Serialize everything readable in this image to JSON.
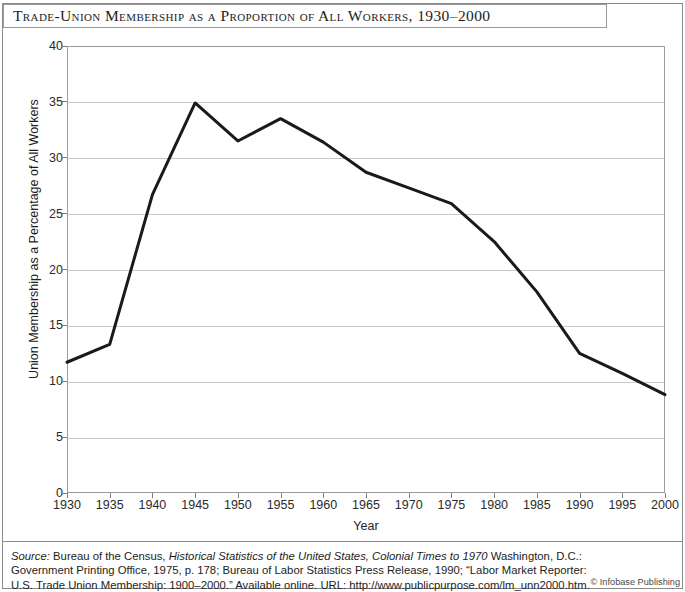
{
  "title": "Trade-Union Membership as a Proportion of All Workers, 1930–2000",
  "credit": "© Infobase Publishing",
  "source": {
    "label": "Source:",
    "line1_a": " Bureau of the Census, ",
    "line1_ital": "Historical Statistics of the United States, Colonial Times to 1970",
    "line1_b": " Washington, D.C.:",
    "line2": "Government Printing Office, 1975, p. 178; Bureau of Labor Statistics Press Release, 1990; “Labor Market Reporter:",
    "line3": "U.S. Trade Union Membership: 1900–2000.” Available online. URL: http://www.publicpurpose.com/lm_unn2000.htm."
  },
  "chart_data": {
    "type": "line",
    "title": "Trade-Union Membership as a Proportion of All Workers, 1930–2000",
    "xlabel": "Year",
    "ylabel": "Union Membership as a Percentage of All Workers",
    "xlim": [
      1930,
      2000
    ],
    "ylim": [
      0,
      40
    ],
    "ytick_step": 5,
    "xtick_step": 5,
    "grid": "horizontal",
    "legend": "none",
    "line_color": "#1a1a1a",
    "line_width": 3,
    "x": [
      1930,
      1935,
      1940,
      1945,
      1950,
      1955,
      1960,
      1965,
      1970,
      1975,
      1980,
      1985,
      1990,
      1995,
      2000
    ],
    "y": [
      11.7,
      13.3,
      26.7,
      34.9,
      31.5,
      33.5,
      31.4,
      28.7,
      27.3,
      25.9,
      22.5,
      18.0,
      12.5,
      10.7,
      8.8
    ],
    "xticks": [
      "1930",
      "1935",
      "1940",
      "1945",
      "1950",
      "1955",
      "1960",
      "1965",
      "1970",
      "1975",
      "1980",
      "1985",
      "1990",
      "1995",
      "2000"
    ],
    "yticks": [
      "0",
      "5",
      "10",
      "15",
      "20",
      "25",
      "30",
      "35",
      "40"
    ],
    "series": [
      {
        "name": "Union membership as a percentage of all workers",
        "values": [
          11.7,
          13.3,
          26.7,
          34.9,
          31.5,
          33.5,
          31.4,
          28.7,
          27.3,
          25.9,
          22.5,
          18.0,
          12.5,
          10.7,
          8.8
        ]
      }
    ]
  }
}
